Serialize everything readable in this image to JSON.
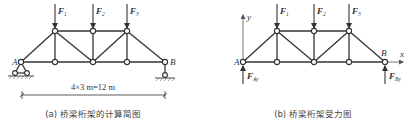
{
  "figure_a": {
    "caption": "(a) 桥梁桁架的计算简图",
    "dimension_label": "4×3 m=12 m",
    "support_left_label": "A",
    "support_right_label": "B",
    "loads": [
      {
        "label": "F",
        "sub": "1"
      },
      {
        "label": "F",
        "sub": "2"
      },
      {
        "label": "F",
        "sub": "3"
      }
    ]
  },
  "figure_b": {
    "caption": "(b) 桥梁桁架受力图",
    "axis_x_label": "x",
    "axis_y_label": "y",
    "node_left_label": "A",
    "node_right_label": "B",
    "loads": [
      {
        "label": "F",
        "sub": "1"
      },
      {
        "label": "F",
        "sub": "2"
      },
      {
        "label": "F",
        "sub": "3"
      }
    ],
    "reactions": [
      {
        "label": "F",
        "sub": "Ay"
      },
      {
        "label": "F",
        "sub": "By"
      }
    ]
  },
  "colors": {
    "line": "#333333",
    "background": "#ffffff"
  }
}
